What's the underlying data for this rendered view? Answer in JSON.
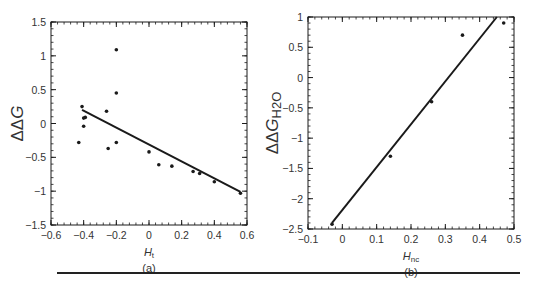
{
  "chart_data": [
    {
      "id": "a",
      "type": "scatter",
      "panel_label": "(a)",
      "title": "",
      "xlabel": "H",
      "xlabel_sub": "t",
      "ylabel": "ΔΔG",
      "ylabel_sub": "",
      "xlim": [
        -0.6,
        0.6
      ],
      "ylim": [
        -1.5,
        1.5
      ],
      "xticks": [
        -0.6,
        -0.4,
        -0.2,
        0,
        0.2,
        0.4,
        0.6
      ],
      "xtick_labels": [
        "−0.6",
        "−0.4",
        "−0.2",
        "0",
        "0.2",
        "0.4",
        "0.6"
      ],
      "yticks": [
        -1.5,
        -1,
        -0.5,
        0,
        0.5,
        1,
        1.5
      ],
      "ytick_labels": [
        "−1.5",
        "−1",
        "−0.5",
        "0",
        "0.5",
        "1",
        "1.5"
      ],
      "grid": false,
      "legend": null,
      "series": [
        {
          "name": "data",
          "points": [
            [
              -0.43,
              -0.28
            ],
            [
              -0.41,
              0.25
            ],
            [
              -0.4,
              0.08
            ],
            [
              -0.39,
              0.09
            ],
            [
              -0.4,
              -0.04
            ],
            [
              -0.26,
              0.18
            ],
            [
              -0.25,
              -0.37
            ],
            [
              -0.2,
              1.09
            ],
            [
              -0.2,
              0.45
            ],
            [
              -0.2,
              -0.28
            ],
            [
              0.0,
              -0.42
            ],
            [
              0.06,
              -0.61
            ],
            [
              0.14,
              -0.63
            ],
            [
              0.27,
              -0.71
            ],
            [
              0.31,
              -0.74
            ],
            [
              0.4,
              -0.86
            ],
            [
              0.56,
              -1.03
            ]
          ]
        }
      ],
      "fit_line": [
        [
          -0.41,
          0.2
        ],
        [
          0.56,
          -1.01
        ]
      ]
    },
    {
      "id": "b",
      "type": "scatter",
      "panel_label": "(b)",
      "title": "",
      "xlabel": "H",
      "xlabel_sub": "nc",
      "ylabel": "ΔΔG",
      "ylabel_sub": "H2O",
      "xlim": [
        -0.1,
        0.5
      ],
      "ylim": [
        -2.5,
        1
      ],
      "xticks": [
        -0.1,
        0,
        0.1,
        0.2,
        0.3,
        0.4,
        0.5
      ],
      "xtick_labels": [
        "−0.1",
        "0",
        "0.1",
        "0.2",
        "0.3",
        "0.4",
        "0.5"
      ],
      "yticks": [
        -2.5,
        -2,
        -1.5,
        -1,
        -0.5,
        0,
        0.5,
        1
      ],
      "ytick_labels": [
        "−2.5",
        "−2",
        "−1.5",
        "−1",
        "−0.5",
        "0",
        "0.5",
        "1"
      ],
      "grid": false,
      "legend": null,
      "series": [
        {
          "name": "data",
          "points": [
            [
              -0.03,
              -2.42
            ],
            [
              0.14,
              -1.3
            ],
            [
              0.26,
              -0.4
            ],
            [
              0.35,
              0.7
            ],
            [
              0.47,
              0.9
            ]
          ]
        }
      ],
      "fit_line": [
        [
          -0.03,
          -2.4
        ],
        [
          0.45,
          1.0
        ]
      ]
    }
  ],
  "layout": {
    "panels": [
      {
        "left": 51,
        "top": 22,
        "right": 247,
        "bottom": 225
      },
      {
        "left": 308,
        "top": 17,
        "right": 514,
        "bottom": 229
      }
    ],
    "divider": {
      "x1": 57,
      "x2": 520,
      "y": 273
    },
    "ink_color": "#1a1a1a"
  }
}
